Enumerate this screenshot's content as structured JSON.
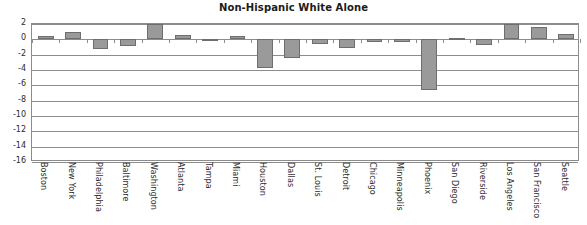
{
  "chart_data": {
    "type": "bar",
    "title": "Non-Hispanic White Alone",
    "xlabel": "",
    "ylabel": "",
    "ylim": [
      -16,
      2
    ],
    "yticks": [
      2,
      0,
      -2,
      -4,
      -6,
      -8,
      -10,
      -12,
      -14,
      -16
    ],
    "ytick_labels": [
      "2",
      "0",
      "-2",
      "-4",
      "-6",
      "-8",
      "-10",
      "-12",
      "-14",
      "-16"
    ],
    "grid": true,
    "legend": null,
    "bar_color": "#9a9a9a",
    "bar_edge_color": "#6e6e6e",
    "categories": [
      "Boston",
      "New York",
      "Philadelphia",
      "Baltimore",
      "Washington",
      "Atlanta",
      "Tampa",
      "Miami",
      "Houston",
      "Dallas",
      "St. Louis",
      "Detroit",
      "Chicago",
      "Minneapolis",
      "Phoenix",
      "San Diego",
      "Riverside",
      "Los Angeles",
      "San Francisco",
      "Seattle"
    ],
    "values": [
      0.4,
      1.0,
      -1.3,
      -0.9,
      2.0,
      0.6,
      -0.1,
      0.5,
      -3.8,
      -2.4,
      -0.6,
      -1.1,
      -0.3,
      -0.3,
      -6.6,
      0.2,
      -0.8,
      2.0,
      1.6,
      0.7
    ]
  }
}
